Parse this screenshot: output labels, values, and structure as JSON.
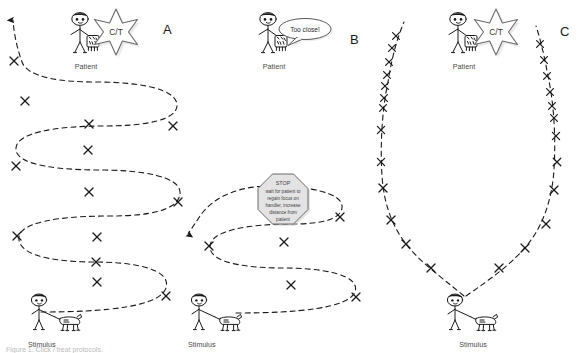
{
  "figure": {
    "caption": "Figure 1. Click / treat protocols.",
    "background": "#ffffff",
    "ink_color": "#1a1a1a"
  },
  "panels": [
    {
      "id": "A",
      "label": "A",
      "label_pos": {
        "x": 163,
        "y": 28
      },
      "description": "Full serpentine approach with click/treat marks at every pass",
      "patient": {
        "label": "Patient",
        "x": 74,
        "y": 12
      },
      "stimulus": {
        "label": "Stimulus",
        "x": 38,
        "y": 296
      },
      "reward_marker": {
        "label": "C/T",
        "shown": true,
        "x": 104,
        "y": 8
      },
      "speech_bubble": {
        "shown": false,
        "text": ""
      },
      "stop_sign": {
        "shown": false
      },
      "path_marks": 12,
      "path_arrow": "up"
    },
    {
      "id": "B",
      "label": "B",
      "label_pos": {
        "x": 350,
        "y": 38
      },
      "description": "Approach interrupted: patient says Too close!, handler halts at STOP sign",
      "patient": {
        "label": "Patient",
        "x": 262,
        "y": 12
      },
      "stimulus": {
        "label": "Stimulus",
        "x": 196,
        "y": 296
      },
      "reward_marker": {
        "label": "C/T",
        "shown": false
      },
      "speech_bubble": {
        "shown": true,
        "text": "Too close!"
      },
      "stop_sign": {
        "shown": true,
        "title": "STOP",
        "lines": [
          "wait for patient to",
          "regain focus on",
          "handler, increase",
          "distance from",
          "patient"
        ]
      },
      "path_marks": 5,
      "path_arrow": "down-left"
    },
    {
      "id": "C",
      "label": "C",
      "label_pos": {
        "x": 562,
        "y": 30
      },
      "description": "Straight V approach and retreat with dense click/treat marks",
      "patient": {
        "label": "Patient",
        "x": 452,
        "y": 12
      },
      "stimulus": {
        "label": "Stimulus",
        "x": 444,
        "y": 288
      },
      "reward_marker": {
        "label": "C/T",
        "shown": true,
        "x": 484,
        "y": 8
      },
      "speech_bubble": {
        "shown": false,
        "text": ""
      },
      "stop_sign": {
        "shown": false
      },
      "path_marks": 28,
      "path_arrow": "none"
    }
  ],
  "legend": {
    "x_mark_meaning": "C/T",
    "dashed_line_meaning": "path of travel"
  }
}
